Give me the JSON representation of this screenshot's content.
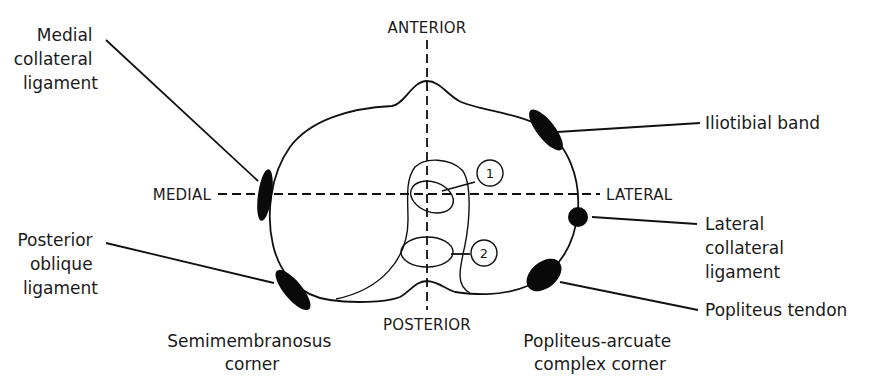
{
  "diagram": {
    "axes": {
      "anterior": "ANTERIOR",
      "posterior": "POSTERIOR",
      "medial": "MEDIAL",
      "lateral": "LATERAL"
    },
    "markers": {
      "one": "1",
      "two": "2"
    },
    "labels": {
      "medial_collateral": [
        "Medial",
        "collateral",
        "ligament"
      ],
      "posterior_oblique": [
        "Posterior",
        "oblique",
        "ligament"
      ],
      "semimembranosus": [
        "Semimembranosus",
        "corner"
      ],
      "iliotibial": "Iliotibial band",
      "lateral_collateral": [
        "Lateral",
        "collateral",
        "ligament"
      ],
      "popliteus_tendon": "Popliteus tendon",
      "popliteus_arcuate": [
        "Popliteus-arcuate",
        "complex corner"
      ]
    },
    "colors": {
      "line": "#111111",
      "ligament_fill": "#0a0a0a",
      "background": "#ffffff"
    }
  }
}
